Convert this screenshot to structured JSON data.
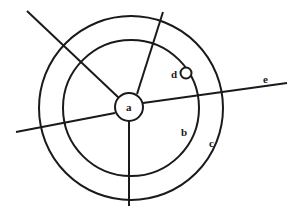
{
  "diagram": {
    "stroke_color": "#1a1a1a",
    "background": "#ffffff",
    "labels": {
      "a": "a",
      "b": "b",
      "c": "c",
      "d": "d",
      "e": "e"
    },
    "shapes": {
      "center_circle": {
        "label": "a",
        "cx": 129,
        "cy": 107,
        "r": 14
      },
      "inner_circle": {
        "label": "b",
        "cx": 131,
        "cy": 108,
        "r": 68
      },
      "outer_circle": {
        "label": "c",
        "cx": 131,
        "cy": 108,
        "r": 92
      },
      "small_circle": {
        "label": "d",
        "cx": 186,
        "cy": 73,
        "r": 5.5
      }
    },
    "lines": [
      {
        "name": "line-upper-left",
        "x1": 27,
        "y1": 11,
        "x2": 119,
        "y2": 98
      },
      {
        "name": "line-upper",
        "x1": 163,
        "y1": 12,
        "x2": 137,
        "y2": 94
      },
      {
        "name": "line-e",
        "label": "e",
        "x1": 287,
        "y1": 83,
        "x2": 143,
        "y2": 103
      },
      {
        "name": "line-left",
        "x1": 16,
        "y1": 132,
        "x2": 115,
        "y2": 113
      },
      {
        "name": "line-bottom",
        "x1": 129,
        "y1": 121,
        "x2": 129,
        "y2": 206
      }
    ]
  }
}
